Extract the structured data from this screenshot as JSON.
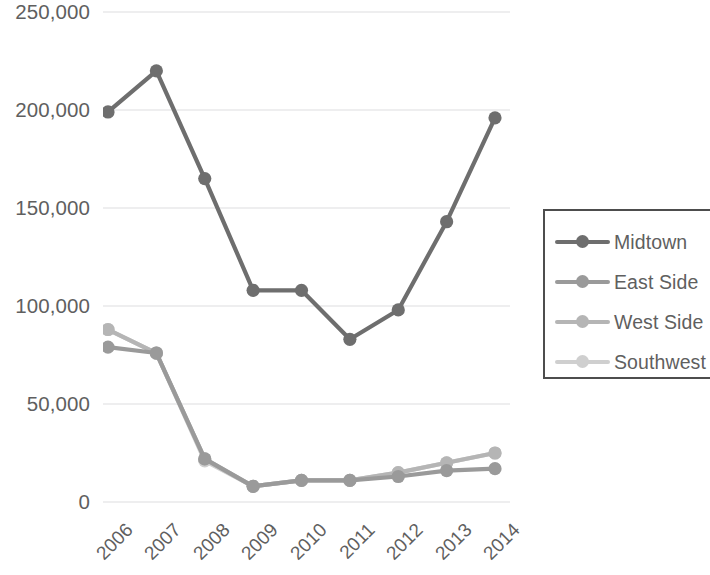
{
  "chart_data": {
    "type": "line",
    "title": "",
    "xlabel": "",
    "ylabel": "",
    "categories": [
      "2006",
      "2007",
      "2008",
      "2009",
      "2010",
      "2011",
      "2012",
      "2013",
      "2014"
    ],
    "ylim": [
      0,
      250000
    ],
    "ytick_values": [
      0,
      50000,
      100000,
      150000,
      200000,
      250000
    ],
    "ytick_labels": [
      "0",
      "50,000",
      "100,000",
      "150,000",
      "200,000",
      "250,000"
    ],
    "grid": true,
    "grid_axis": "y",
    "legend_position": "right",
    "series": [
      {
        "name": "Midtown",
        "color": "#6e6e6e",
        "values": [
          199000,
          220000,
          165000,
          108000,
          108000,
          83000,
          98000,
          143000,
          196000
        ]
      },
      {
        "name": "East Side",
        "color": "#9a9a9a",
        "values": [
          79000,
          76000,
          22000,
          8000,
          11000,
          11000,
          13000,
          16000,
          17000
        ]
      },
      {
        "name": "West Side",
        "color": "#b5b5b5",
        "values": [
          88000,
          76000,
          22000,
          8000,
          11000,
          11000,
          15000,
          20000,
          25000
        ]
      },
      {
        "name": "Southwest",
        "color": "#cfcfcf",
        "values": [
          88000,
          76000,
          21000,
          8000,
          11000,
          11000,
          15000,
          20000,
          25000
        ]
      }
    ]
  },
  "legend": {
    "items": [
      {
        "label": "Midtown"
      },
      {
        "label": "East Side"
      },
      {
        "label": "West Side"
      },
      {
        "label": "Southwest"
      }
    ]
  },
  "axes": {
    "y_tick_labels": [
      "250,000",
      "200,000",
      "150,000",
      "100,000",
      "50,000",
      "0"
    ],
    "x_tick_labels": [
      "2006",
      "2007",
      "2008",
      "2009",
      "2010",
      "2011",
      "2012",
      "2013",
      "2014"
    ]
  },
  "style": {
    "gridline_color": "#e8e8ea",
    "text_color": "#5f5f5f",
    "legend_border_color": "#4d4d4d",
    "background": "#ffffff"
  }
}
